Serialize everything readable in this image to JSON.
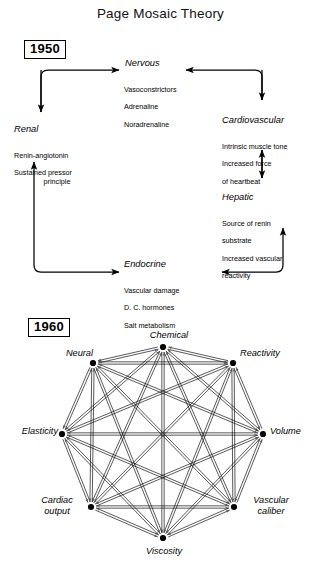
{
  "title": "Page Mosaic Theory",
  "diagram_1950": {
    "year_label": "1950",
    "nodes": [
      {
        "id": "nervous",
        "title": "Nervous",
        "lines": [
          "Vasoconstrictors",
          "Adrenaline",
          "Noradrenaline"
        ]
      },
      {
        "id": "renal",
        "title": "Renal",
        "lines": [
          "Renin-angiotonin",
          "Sustained pressor",
          "principle"
        ]
      },
      {
        "id": "cardiovascular",
        "title": "Cardiovascular",
        "lines": [
          "Intrinsic muscle tone",
          "Increased force",
          "of heartbeat"
        ]
      },
      {
        "id": "hepatic",
        "title": "Hepatic",
        "lines": [
          "Source of renin",
          "substrate",
          "Increased vascular",
          "reactivity"
        ]
      },
      {
        "id": "endocrine",
        "title": "Endocrine",
        "lines": [
          "Vascular damage",
          "D. C. hormones",
          "Salt metabolism"
        ]
      }
    ]
  },
  "diagram_1960": {
    "year_label": "1960",
    "nodes": [
      {
        "id": "chemical",
        "label": "Chemical",
        "x": 163,
        "y": 347
      },
      {
        "id": "reactivity",
        "label": "Reactivity",
        "x": 233,
        "y": 363
      },
      {
        "id": "volume",
        "label": "Volume",
        "x": 263,
        "y": 434
      },
      {
        "id": "vascular-caliber",
        "label": "Vascular\ncaliber",
        "x": 234,
        "y": 507
      },
      {
        "id": "viscosity",
        "label": "Viscosity",
        "x": 163,
        "y": 538
      },
      {
        "id": "cardiac-output",
        "label": "Cardiac\noutput",
        "x": 91,
        "y": 507
      },
      {
        "id": "elasticity",
        "label": "Elasticity",
        "x": 62,
        "y": 434
      },
      {
        "id": "neural",
        "label": "Neural",
        "x": 93,
        "y": 363
      }
    ]
  },
  "colors": {
    "ink": "#000000",
    "background": "#ffffff"
  }
}
